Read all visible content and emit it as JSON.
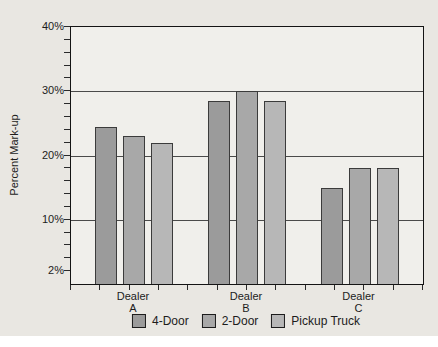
{
  "chart_data": {
    "type": "bar",
    "title": "",
    "xlabel": "",
    "ylabel": "Percent Mark-up",
    "categories": [
      "Dealer A",
      "Dealer B",
      "Dealer C"
    ],
    "category_labels": [
      {
        "line1": "Dealer",
        "line2": "A"
      },
      {
        "line1": "Dealer",
        "line2": "B"
      },
      {
        "line1": "Dealer",
        "line2": "C"
      }
    ],
    "series": [
      {
        "name": "4-Door",
        "color": "#9b9b9b",
        "values": [
          24.5,
          28.5,
          15
        ]
      },
      {
        "name": "2-Door",
        "color": "#a8a8a8",
        "values": [
          23,
          30,
          18
        ]
      },
      {
        "name": "Pickup Truck",
        "color": "#b7b7b7",
        "values": [
          22,
          28.5,
          18
        ]
      }
    ],
    "y_axis": {
      "min": 0,
      "max": 40,
      "major_gridlines": [
        10,
        20,
        30,
        40
      ],
      "labeled_values": [
        40,
        30,
        20,
        10,
        2
      ],
      "tick_label_texts": [
        "40%",
        "30%",
        "20%",
        "10%",
        "2%"
      ],
      "minor_tick_step": 2
    },
    "grid": true,
    "legend_position": "bottom",
    "colors": {
      "page_background": "#e9e7e2",
      "plot_background": "#f0efeb",
      "gridline": "#4a4a4a",
      "axis_border": "#141414",
      "text": "#1c1c1c"
    }
  }
}
